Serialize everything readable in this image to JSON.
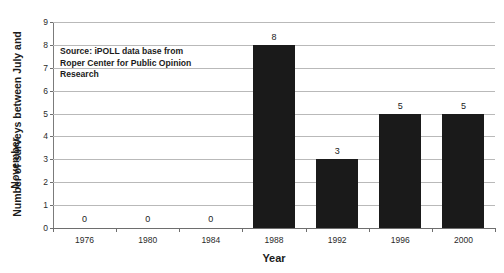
{
  "chart_data": {
    "type": "bar",
    "title": "",
    "xlabel": "Year",
    "ylabel_line1": "Number of surveys between July and",
    "ylabel_line2": "November",
    "categories": [
      "1976",
      "1980",
      "1984",
      "1988",
      "1992",
      "1996",
      "2000"
    ],
    "values": [
      0,
      0,
      0,
      8,
      3,
      5,
      5
    ],
    "value_labels": [
      "0",
      "0",
      "0",
      "8",
      "3",
      "5",
      "5"
    ],
    "ylim": [
      0,
      9
    ],
    "ytick_labels": [
      "0",
      "1",
      "2",
      "3",
      "4",
      "5",
      "6",
      "7",
      "8",
      "9"
    ],
    "ytick_values": [
      0,
      1,
      2,
      3,
      4,
      5,
      6,
      7,
      8,
      9
    ],
    "grid": true,
    "legend": "none",
    "series_color": "#1a1a1a",
    "gridline_color": "#b9b9b9",
    "axis_color": "#6e6e6e",
    "annotation": {
      "line1": "Source: iPOLL data base from",
      "line2": "Roper Center for Public Opinion",
      "line3": "Research"
    }
  },
  "clipped_title": "",
  "colors": {
    "background": "#ffffff",
    "bar": "#1a1a1a",
    "text": "#1b1b1b",
    "grid": "#b9b9b9"
  }
}
